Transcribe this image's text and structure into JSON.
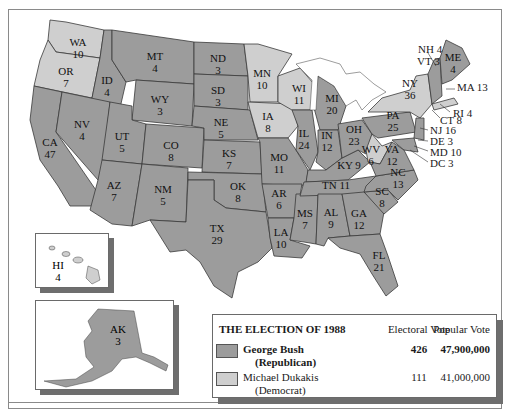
{
  "map": {
    "title": "THE ELECTION OF 1988",
    "colors": {
      "republican": "#9c9c9c",
      "democrat": "#cfcfcf",
      "border": "#3a3a3a"
    },
    "states": [
      {
        "abbr": "WA",
        "votes": "10",
        "party": "D"
      },
      {
        "abbr": "OR",
        "votes": "7",
        "party": "D"
      },
      {
        "abbr": "CA",
        "votes": "47",
        "party": "R"
      },
      {
        "abbr": "ID",
        "votes": "4",
        "party": "R"
      },
      {
        "abbr": "NV",
        "votes": "4",
        "party": "R"
      },
      {
        "abbr": "MT",
        "votes": "4",
        "party": "R"
      },
      {
        "abbr": "WY",
        "votes": "3",
        "party": "R"
      },
      {
        "abbr": "UT",
        "votes": "5",
        "party": "R"
      },
      {
        "abbr": "AZ",
        "votes": "7",
        "party": "R"
      },
      {
        "abbr": "CO",
        "votes": "8",
        "party": "R"
      },
      {
        "abbr": "NM",
        "votes": "5",
        "party": "R"
      },
      {
        "abbr": "ND",
        "votes": "3",
        "party": "R"
      },
      {
        "abbr": "SD",
        "votes": "3",
        "party": "R"
      },
      {
        "abbr": "NE",
        "votes": "5",
        "party": "R"
      },
      {
        "abbr": "KS",
        "votes": "7",
        "party": "R"
      },
      {
        "abbr": "OK",
        "votes": "8",
        "party": "R"
      },
      {
        "abbr": "TX",
        "votes": "29",
        "party": "R"
      },
      {
        "abbr": "MN",
        "votes": "10",
        "party": "D"
      },
      {
        "abbr": "IA",
        "votes": "8",
        "party": "D"
      },
      {
        "abbr": "MO",
        "votes": "11",
        "party": "R"
      },
      {
        "abbr": "AR",
        "votes": "6",
        "party": "R"
      },
      {
        "abbr": "LA",
        "votes": "10",
        "party": "R"
      },
      {
        "abbr": "WI",
        "votes": "11",
        "party": "D"
      },
      {
        "abbr": "IL",
        "votes": "24",
        "party": "R"
      },
      {
        "abbr": "MS",
        "votes": "7",
        "party": "R"
      },
      {
        "abbr": "MI",
        "votes": "20",
        "party": "R"
      },
      {
        "abbr": "IN",
        "votes": "12",
        "party": "R"
      },
      {
        "abbr": "KY",
        "votes": "9",
        "party": "R"
      },
      {
        "abbr": "TN",
        "votes": "11",
        "party": "R"
      },
      {
        "abbr": "AL",
        "votes": "9",
        "party": "R"
      },
      {
        "abbr": "OH",
        "votes": "23",
        "party": "R"
      },
      {
        "abbr": "GA",
        "votes": "12",
        "party": "R"
      },
      {
        "abbr": "FL",
        "votes": "21",
        "party": "R"
      },
      {
        "abbr": "SC",
        "votes": "8",
        "party": "R"
      },
      {
        "abbr": "NC",
        "votes": "13",
        "party": "R"
      },
      {
        "abbr": "WV",
        "votes": "6",
        "party": "D"
      },
      {
        "abbr": "VA",
        "votes": "12",
        "party": "R"
      },
      {
        "abbr": "PA",
        "votes": "25",
        "party": "R"
      },
      {
        "abbr": "NY",
        "votes": "36",
        "party": "D"
      },
      {
        "abbr": "ME",
        "votes": "4",
        "party": "R"
      },
      {
        "abbr": "NH",
        "votes": "4",
        "party": "R"
      },
      {
        "abbr": "VT",
        "votes": "3",
        "party": "R"
      },
      {
        "abbr": "MA",
        "votes": "13",
        "party": "D"
      },
      {
        "abbr": "RI",
        "votes": "4",
        "party": "D"
      },
      {
        "abbr": "CT",
        "votes": "8",
        "party": "R"
      },
      {
        "abbr": "NJ",
        "votes": "16",
        "party": "R"
      },
      {
        "abbr": "DE",
        "votes": "3",
        "party": "R"
      },
      {
        "abbr": "MD",
        "votes": "10",
        "party": "R"
      },
      {
        "abbr": "DC",
        "votes": "3",
        "party": "D"
      },
      {
        "abbr": "HI",
        "votes": "4",
        "party": "D"
      },
      {
        "abbr": "AK",
        "votes": "3",
        "party": "R"
      }
    ],
    "callouts": {
      "nh": "NH 4",
      "vt": "VT 3",
      "ma": "MA 13",
      "ri": "RI 4",
      "ct": "CT 8",
      "nj": "NJ 16",
      "de": "DE 3",
      "md": "MD 10",
      "dc": "DC 3",
      "ky": "KY 9",
      "tn": "TN 11"
    }
  },
  "legend": {
    "title": "THE ELECTION OF 1988",
    "col_electoral": "Electoral Vote",
    "col_popular": "Popular Vote",
    "rows": [
      {
        "name": "George Bush",
        "party": "(Republican)",
        "electoral": "426",
        "popular": "47,900,000",
        "color": "#9c9c9c"
      },
      {
        "name": "Michael Dukakis",
        "party": "(Democrat)",
        "electoral": "111",
        "popular": "41,000,000",
        "color": "#cfcfcf"
      }
    ]
  }
}
